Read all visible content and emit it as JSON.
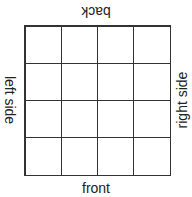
{
  "labels": {
    "back": "back",
    "front": "front",
    "left": "left side",
    "right": "right side"
  },
  "grid": {
    "rows": 4,
    "cols": 4
  }
}
